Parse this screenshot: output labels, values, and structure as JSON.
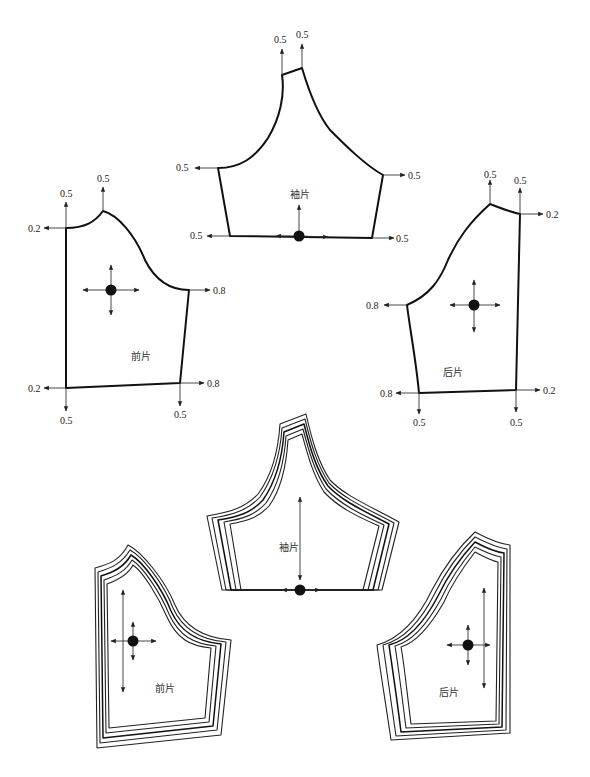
{
  "top_section": {
    "sleeve": {
      "name": "袖片",
      "grade_labels": {
        "cap_left": "0.5",
        "cap_right": "0.5",
        "underarm_left": "0.5",
        "underarm_right": "0.5",
        "hem_left": "0.5",
        "hem_right": "0.5"
      }
    },
    "front": {
      "name": "前片",
      "grade_labels": {
        "neck_up": "0.5",
        "shoulder_up": "0.5",
        "neck_left": "0.2",
        "armhole_right": "0.8",
        "hem_left": "0.2",
        "hem_right": "0.8",
        "hem_left_down": "0.5",
        "hem_right_down": "0.5"
      }
    },
    "back": {
      "name": "后片",
      "grade_labels": {
        "shoulder_up": "0.5",
        "neck_up": "0.5",
        "neck_right": "0.2",
        "armhole_left": "0.8",
        "hem_left": "0.8",
        "hem_right": "0.2",
        "hem_left_down": "0.5",
        "hem_right_down": "0.5"
      }
    }
  },
  "bottom_section": {
    "sleeve_name": "袖片",
    "front_name": "前片",
    "back_name": "后片",
    "nest_count": 5
  },
  "colors": {
    "line": "#111111",
    "background": "#ffffff"
  }
}
